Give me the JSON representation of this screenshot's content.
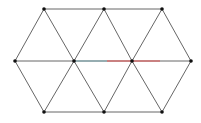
{
  "diagram": {
    "type": "triangular-lattice-hexagon",
    "colors": {
      "edge": "#555555",
      "vertex": "#111111",
      "highlight_red": "#e05050",
      "highlight_teal": "#7aa8b0",
      "background": "#ffffff"
    },
    "vertices": [
      {
        "id": "t1",
        "x": 44,
        "y": 9
      },
      {
        "id": "t2",
        "x": 104,
        "y": 9
      },
      {
        "id": "t3",
        "x": 162,
        "y": 9
      },
      {
        "id": "m1",
        "x": 15,
        "y": 61
      },
      {
        "id": "m2",
        "x": 74,
        "y": 61
      },
      {
        "id": "m3",
        "x": 132,
        "y": 61
      },
      {
        "id": "m4",
        "x": 191,
        "y": 61
      },
      {
        "id": "b1",
        "x": 44,
        "y": 112
      },
      {
        "id": "b2",
        "x": 104,
        "y": 112
      },
      {
        "id": "b3",
        "x": 162,
        "y": 112
      }
    ],
    "edges": [
      [
        "t1",
        "t2"
      ],
      [
        "t2",
        "t3"
      ],
      [
        "m1",
        "m2"
      ],
      [
        "m2",
        "m3"
      ],
      [
        "m3",
        "m4"
      ],
      [
        "b1",
        "b2"
      ],
      [
        "b2",
        "b3"
      ],
      [
        "t1",
        "m1"
      ],
      [
        "t1",
        "m2"
      ],
      [
        "t2",
        "m2"
      ],
      [
        "t2",
        "m3"
      ],
      [
        "t3",
        "m3"
      ],
      [
        "t3",
        "m4"
      ],
      [
        "b1",
        "m1"
      ],
      [
        "b1",
        "m2"
      ],
      [
        "b2",
        "m2"
      ],
      [
        "b2",
        "m3"
      ],
      [
        "b3",
        "m3"
      ],
      [
        "b3",
        "m4"
      ]
    ],
    "highlights": [
      {
        "x1": 74,
        "y1": 61,
        "x2": 107,
        "y2": 61,
        "color": "#7aa8b0"
      },
      {
        "x1": 107,
        "y1": 61,
        "x2": 160,
        "y2": 61,
        "color": "#e05050"
      }
    ]
  }
}
